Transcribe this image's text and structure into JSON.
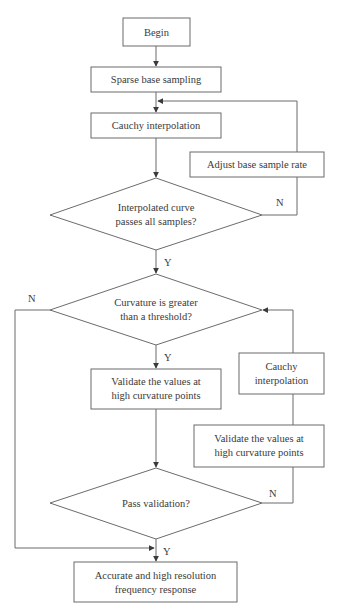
{
  "diagram": {
    "type": "flowchart",
    "nodes": {
      "begin": {
        "shape": "box",
        "lines": [
          "Begin"
        ]
      },
      "sparse": {
        "shape": "box",
        "lines": [
          "Sparse base sampling"
        ]
      },
      "cauchy1": {
        "shape": "box",
        "lines": [
          "Cauchy interpolation"
        ]
      },
      "adjust": {
        "shape": "box",
        "lines": [
          "Adjust base sample rate"
        ]
      },
      "check_samples": {
        "shape": "decision",
        "lines": [
          "Interpolated curve",
          "passes all samples?"
        ]
      },
      "curvature": {
        "shape": "decision",
        "lines": [
          "Curvature is greater",
          "than a threshold?"
        ]
      },
      "validate1": {
        "shape": "box",
        "lines": [
          "Validate the values at",
          "high curvature points"
        ]
      },
      "cauchy2": {
        "shape": "box",
        "lines": [
          "Cauchy",
          "interpolation"
        ]
      },
      "validate2": {
        "shape": "box",
        "lines": [
          "Validate the values at",
          "high curvature points"
        ]
      },
      "pass_validation": {
        "shape": "decision",
        "lines": [
          "Pass validation?"
        ]
      },
      "result": {
        "shape": "box",
        "lines": [
          "Accurate and high resolution",
          "frequency response"
        ]
      }
    },
    "edges": [
      {
        "from": "begin",
        "to": "sparse",
        "label": ""
      },
      {
        "from": "sparse",
        "to": "cauchy1",
        "label": ""
      },
      {
        "from": "cauchy1",
        "to": "check_samples",
        "label": ""
      },
      {
        "from": "check_samples",
        "to": "adjust",
        "label": "N"
      },
      {
        "from": "adjust",
        "to": "cauchy1",
        "label": ""
      },
      {
        "from": "check_samples",
        "to": "curvature",
        "label": "Y"
      },
      {
        "from": "curvature",
        "to": "validate1",
        "label": "Y"
      },
      {
        "from": "curvature",
        "to": "result",
        "label": "N"
      },
      {
        "from": "validate1",
        "to": "pass_validation",
        "label": ""
      },
      {
        "from": "pass_validation",
        "to": "validate2",
        "label": "N"
      },
      {
        "from": "validate2",
        "to": "cauchy2",
        "label": ""
      },
      {
        "from": "cauchy2",
        "to": "curvature",
        "label": ""
      },
      {
        "from": "pass_validation",
        "to": "result",
        "label": "Y"
      }
    ],
    "edge_labels": {
      "check_no": "N",
      "check_yes": "Y",
      "curvature_no": "N",
      "curvature_yes": "Y",
      "validation_no": "N",
      "validation_yes": "Y"
    }
  }
}
